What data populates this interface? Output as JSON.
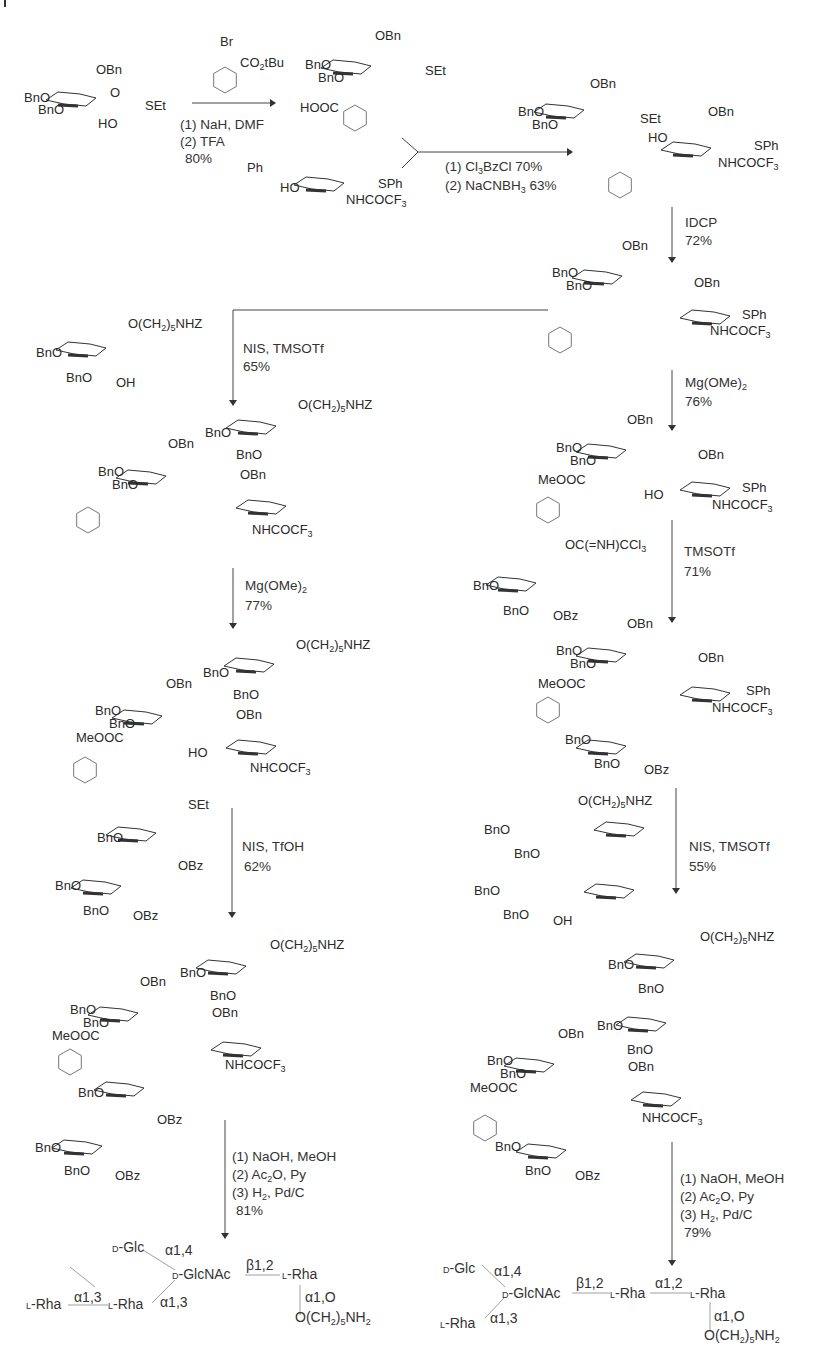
{
  "page": {
    "type": "book page - synthetic scheme",
    "caption": ""
  },
  "scheme": {
    "reagents": {
      "benzyl_bromide": {
        "br": "Br",
        "ester": "CO2tBu"
      },
      "step1": {
        "lines": [
          "(1) NaH, DMF",
          "(2) TFA",
          "80%"
        ]
      },
      "step2": {
        "lines": [
          "(1) Cl3BzCl 70%",
          "(2) NaCNBH3 63%"
        ]
      },
      "step3": {
        "lines": [
          "IDCP",
          "72%"
        ]
      },
      "step4_right": {
        "lines": [
          "Mg(OMe)2",
          "76%"
        ]
      },
      "step4_left": {
        "lines": [
          "NIS, TMSOTf",
          "65%"
        ]
      },
      "step5_left": {
        "lines": [
          "Mg(OMe)2",
          "77%"
        ]
      },
      "step5_right": {
        "lines": [
          "TMSOTf",
          "71%"
        ]
      },
      "step6_left": {
        "lines": [
          "NIS, TfOH",
          "62%"
        ]
      },
      "step6_right": {
        "lines": [
          "NIS, TMSOTf",
          "55%"
        ]
      },
      "final_left": {
        "lines": [
          "(1) NaOH, MeOH",
          "(2) Ac2O, Py",
          "(3) H2, Pd/C",
          "81%"
        ]
      },
      "final_right": {
        "lines": [
          "(1) NaOH, MeOH",
          "(2) Ac2O, Py",
          "(3) H2, Pd/C",
          "79%"
        ]
      }
    },
    "labels": {
      "OBn": "OBn",
      "BnO": "BnO",
      "SEt": "SEt",
      "SPh": "SPh",
      "HO": "HO",
      "OH": "OH",
      "O": "O",
      "HOOC": "HOOC",
      "MeOOC": "MeOOC",
      "NHCOCF3": "NHCOCF3",
      "Ph": "Ph",
      "OBz": "OBz",
      "linker": "O(CH2)5NHZ",
      "imidate": "OC(=NH)CCl3"
    },
    "final_left": {
      "d_glc": "D-Glc",
      "d_glcnac": "D-GlcNAc",
      "l_rha_a": "L-Rha",
      "l_rha_b": "L-Rha",
      "l_rha_c": "L-Rha",
      "link_glc": "α1,4",
      "link_rha_glcnac": "α1,3",
      "link_rha_rha": "α1,3",
      "link_glcnac_rha": "β1,2",
      "link_linker": "α1,O",
      "linker": "O(CH2)5NH2"
    },
    "final_right": {
      "d_glc": "D-Glc",
      "d_glcnac": "D-GlcNAc",
      "l_rha_a": "L-Rha",
      "l_rha_b": "L-Rha",
      "l_rha_c": "L-Rha",
      "link_glc": "α1,4",
      "link_rha_glcnac": "α1,3",
      "link_glcnac_rha": "β1,2",
      "link_rha_rha": "α1,2",
      "link_linker": "α1,O",
      "linker": "O(CH2)5NH2"
    }
  }
}
